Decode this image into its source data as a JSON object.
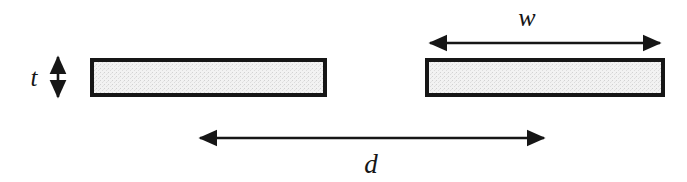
{
  "figure": {
    "type": "engineering-dimension-diagram",
    "background_color": "#ffffff",
    "canvas": {
      "width": 687,
      "height": 182
    }
  },
  "style": {
    "stroke_color": "#161616",
    "bar_border_color": "#161616",
    "bar_fill_color": "#ececec",
    "bar_border_width": 4,
    "arrow_line_width": 2.6,
    "label_color": "#161616"
  },
  "shapes": {
    "bars": [
      {
        "id": "left-bar",
        "name": "left bar",
        "x": 90,
        "y": 58,
        "width": 237,
        "height": 39
      },
      {
        "id": "right-bar",
        "name": "right bar",
        "x": 425,
        "y": 58,
        "width": 240,
        "height": 39
      }
    ]
  },
  "dimensions": [
    {
      "id": "thickness",
      "symbol": "t",
      "meaning": "bar thickness",
      "orientation": "vertical",
      "arrow": {
        "x": 58,
        "y1": 55,
        "y2": 99
      },
      "label_pos": {
        "x": 34,
        "y": 86
      },
      "label_font_size": 25
    },
    {
      "id": "width",
      "symbol": "w",
      "meaning": "bar width",
      "orientation": "horizontal",
      "arrow": {
        "y": 43,
        "x1": 428,
        "x2": 662
      },
      "label_pos": {
        "x": 527,
        "y": 26
      },
      "label_font_size": 26
    },
    {
      "id": "separation",
      "symbol": "d",
      "meaning": "center-to-center separation distance",
      "orientation": "horizontal",
      "arrow": {
        "y": 138,
        "x1": 198,
        "x2": 546
      },
      "label_pos": {
        "x": 371,
        "y": 173
      },
      "label_font_size": 27
    }
  ]
}
